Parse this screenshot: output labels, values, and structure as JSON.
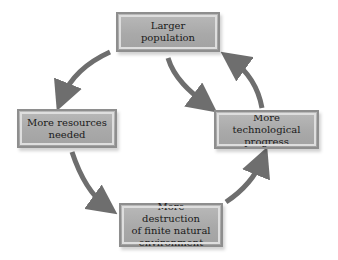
{
  "diagram": {
    "type": "cycle",
    "nodes": [
      {
        "id": "top",
        "label": "Larger\npopulation"
      },
      {
        "id": "right",
        "label": "More technological\nprogress"
      },
      {
        "id": "bottom",
        "label": "More destruction\nof finite natural\nenvironment"
      },
      {
        "id": "left",
        "label": "More resources\nneeded"
      }
    ],
    "edges": [
      {
        "from": "top",
        "to": "right"
      },
      {
        "from": "right",
        "to": "top"
      },
      {
        "from": "top",
        "to": "left"
      },
      {
        "from": "left",
        "to": "bottom"
      },
      {
        "from": "bottom",
        "to": "right"
      }
    ],
    "colors": {
      "box_fill": "#aaaaaa",
      "box_border": "#8e8e8e",
      "box_inner_border": "#dedede",
      "arrow": "#6e6e6e",
      "text": "#1a1a1a",
      "background": "#ffffff"
    }
  }
}
